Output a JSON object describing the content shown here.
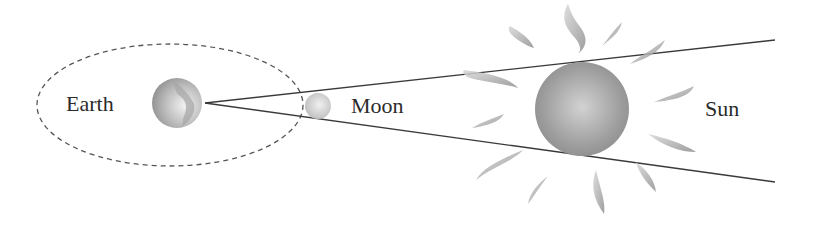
{
  "diagram": {
    "labels": {
      "earth": "Earth",
      "moon": "Moon",
      "sun": "Sun"
    },
    "colors": {
      "line": "#3a3a3a",
      "orbit": "#555555",
      "text": "#2b2b2b",
      "body_light": "#e6e6e6",
      "body_dark": "#8a8a8a",
      "flare": "#9a9a9a"
    }
  }
}
